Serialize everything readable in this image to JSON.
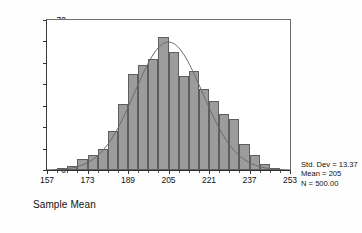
{
  "chart_data": {
    "type": "bar",
    "title": "",
    "subtitle": "",
    "xlabel": "Sample Mean",
    "ylabel": "",
    "xlim": [
      157,
      253
    ],
    "ylim": [
      0,
      70
    ],
    "grid": false,
    "legend_position": "none",
    "bin_width": 4,
    "x_tick_labels": [
      "157",
      "173",
      "189",
      "205",
      "221",
      "237",
      "253"
    ],
    "x_tick_values": [
      157,
      173,
      189,
      205,
      221,
      237,
      253
    ],
    "y_tick_labels": [
      "0",
      "10",
      "20",
      "30",
      "40",
      "50",
      "60",
      "70"
    ],
    "y_tick_values": [
      0,
      10,
      20,
      30,
      40,
      50,
      60,
      70
    ],
    "categories": [
      159,
      163,
      167,
      171,
      175,
      179,
      183,
      187,
      191,
      195,
      199,
      203,
      207,
      211,
      215,
      219,
      223,
      227,
      231,
      235,
      239,
      243,
      247,
      251
    ],
    "values": [
      0,
      1,
      2,
      5,
      7,
      10,
      18,
      31,
      45,
      49,
      52,
      62,
      55,
      44,
      46,
      38,
      32,
      26,
      24,
      12,
      7,
      3,
      1,
      0
    ],
    "series": [
      {
        "name": "Frequency",
        "values": [
          0,
          1,
          2,
          5,
          7,
          10,
          18,
          31,
          45,
          49,
          52,
          62,
          55,
          44,
          46,
          38,
          32,
          26,
          24,
          12,
          7,
          3,
          1,
          0
        ]
      },
      {
        "name": "Normal curve",
        "type": "line",
        "mean": 205,
        "std_dev": 13.37,
        "n": 500,
        "peak": 59.7
      }
    ],
    "annotations": [
      "Std. Dev = 13.37",
      "Mean = 205",
      "N = 500.00"
    ]
  },
  "stats": {
    "std_dev": "Std. Dev = 13.37",
    "mean": "Mean = 205",
    "n": "N = 500.00"
  },
  "axis": {
    "x_title": "Sample Mean"
  }
}
